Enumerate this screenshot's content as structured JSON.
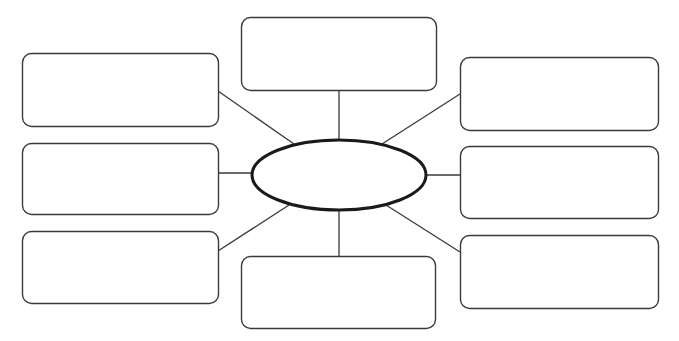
{
  "diagram": {
    "type": "spider-map",
    "stroke_color": "#3a3a3a",
    "ellipse_stroke_color": "#1a1a1a",
    "background": "#ffffff",
    "center": {
      "label": "",
      "cx": 339,
      "cy": 175,
      "rx": 87,
      "ry": 35
    },
    "boxes": [
      {
        "id": "top-center",
        "label": "",
        "x": 241,
        "y": 17,
        "w": 195,
        "h": 73
      },
      {
        "id": "top-left",
        "label": "",
        "x": 22,
        "y": 53,
        "w": 196,
        "h": 73
      },
      {
        "id": "middle-left",
        "label": "",
        "x": 22,
        "y": 143,
        "w": 196,
        "h": 71
      },
      {
        "id": "bottom-left",
        "label": "",
        "x": 22,
        "y": 231,
        "w": 196,
        "h": 72
      },
      {
        "id": "bottom-center",
        "label": "",
        "x": 241,
        "y": 256,
        "w": 194,
        "h": 72
      },
      {
        "id": "top-right",
        "label": "",
        "x": 460,
        "y": 57,
        "w": 198,
        "h": 73
      },
      {
        "id": "middle-right",
        "label": "",
        "x": 460,
        "y": 146,
        "w": 198,
        "h": 72
      },
      {
        "id": "bottom-right",
        "label": "",
        "x": 460,
        "y": 235,
        "w": 198,
        "h": 73
      }
    ],
    "connectors": [
      {
        "to": "top-center",
        "x1": 339,
        "y1": 90,
        "x2": 339,
        "y2": 141
      },
      {
        "to": "top-left",
        "x1": 218,
        "y1": 91,
        "x2": 294,
        "y2": 144
      },
      {
        "to": "middle-left",
        "x1": 218,
        "y1": 173,
        "x2": 252,
        "y2": 173
      },
      {
        "to": "bottom-left",
        "x1": 218,
        "y1": 251,
        "x2": 289,
        "y2": 205
      },
      {
        "to": "bottom-center",
        "x1": 339,
        "y1": 210,
        "x2": 339,
        "y2": 256
      },
      {
        "to": "top-right",
        "x1": 460,
        "y1": 94,
        "x2": 382,
        "y2": 144
      },
      {
        "to": "middle-right",
        "x1": 426,
        "y1": 175,
        "x2": 460,
        "y2": 175
      },
      {
        "to": "bottom-right",
        "x1": 386,
        "y1": 205,
        "x2": 460,
        "y2": 252
      }
    ]
  }
}
